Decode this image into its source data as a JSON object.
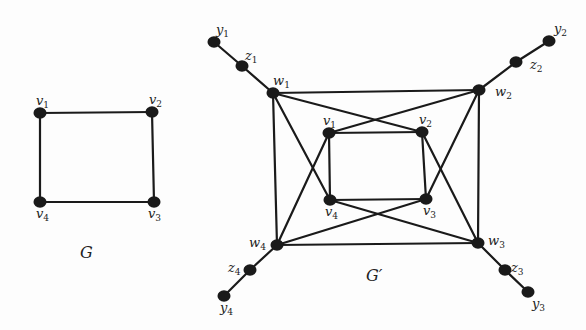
{
  "graphs": [
    {
      "id": "G",
      "title": "G",
      "vertices": [
        {
          "id": "v1",
          "label": "v",
          "sub": "1"
        },
        {
          "id": "v2",
          "label": "v",
          "sub": "2"
        },
        {
          "id": "v3",
          "label": "v",
          "sub": "3"
        },
        {
          "id": "v4",
          "label": "v",
          "sub": "4"
        }
      ],
      "edges": [
        [
          "v1",
          "v2"
        ],
        [
          "v2",
          "v3"
        ],
        [
          "v3",
          "v4"
        ],
        [
          "v4",
          "v1"
        ]
      ]
    },
    {
      "id": "Gprime",
      "title": "G′",
      "vertices": [
        {
          "id": "w1",
          "label": "w",
          "sub": "1"
        },
        {
          "id": "w2",
          "label": "w",
          "sub": "2"
        },
        {
          "id": "w3",
          "label": "w",
          "sub": "3"
        },
        {
          "id": "w4",
          "label": "w",
          "sub": "4"
        },
        {
          "id": "v1",
          "label": "v",
          "sub": "1"
        },
        {
          "id": "v2",
          "label": "v",
          "sub": "2"
        },
        {
          "id": "v3",
          "label": "v",
          "sub": "3"
        },
        {
          "id": "v4",
          "label": "v",
          "sub": "4"
        },
        {
          "id": "z1",
          "label": "z",
          "sub": "1"
        },
        {
          "id": "z2",
          "label": "z",
          "sub": "2"
        },
        {
          "id": "z3",
          "label": "z",
          "sub": "3"
        },
        {
          "id": "z4",
          "label": "z",
          "sub": "4"
        },
        {
          "id": "y1",
          "label": "y",
          "sub": "1"
        },
        {
          "id": "y2",
          "label": "y",
          "sub": "2"
        },
        {
          "id": "y3",
          "label": "y",
          "sub": "3"
        },
        {
          "id": "y4",
          "label": "y",
          "sub": "4"
        }
      ],
      "edges": [
        [
          "w1",
          "w2"
        ],
        [
          "w2",
          "w3"
        ],
        [
          "w3",
          "w4"
        ],
        [
          "w4",
          "w1"
        ],
        [
          "v1",
          "v2"
        ],
        [
          "v2",
          "v3"
        ],
        [
          "v3",
          "v4"
        ],
        [
          "v4",
          "v1"
        ],
        [
          "w1",
          "v2"
        ],
        [
          "w1",
          "v4"
        ],
        [
          "w2",
          "v1"
        ],
        [
          "w2",
          "v3"
        ],
        [
          "w3",
          "v2"
        ],
        [
          "w3",
          "v4"
        ],
        [
          "w4",
          "v1"
        ],
        [
          "w4",
          "v3"
        ],
        [
          "w1",
          "z1"
        ],
        [
          "z1",
          "y1"
        ],
        [
          "w2",
          "z2"
        ],
        [
          "z2",
          "y2"
        ],
        [
          "w3",
          "z3"
        ],
        [
          "z3",
          "y3"
        ],
        [
          "w4",
          "z4"
        ],
        [
          "z4",
          "y4"
        ]
      ]
    }
  ]
}
